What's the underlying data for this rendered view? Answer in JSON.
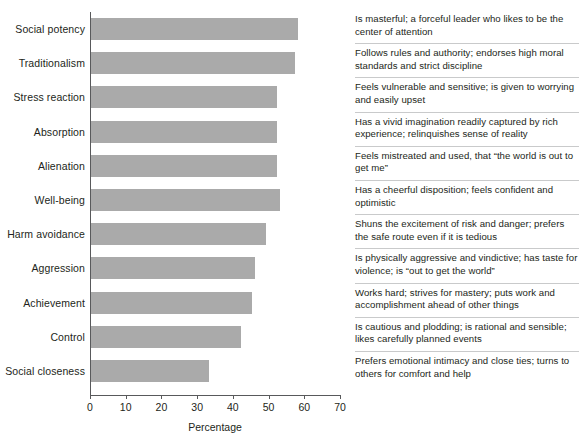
{
  "chart_data": {
    "type": "bar",
    "orientation": "horizontal",
    "title": "",
    "xlabel": "Percentage",
    "ylabel": "",
    "xlim": [
      0,
      70
    ],
    "xticks": [
      0,
      10,
      20,
      30,
      40,
      50,
      60,
      70
    ],
    "grid": false,
    "legend": null,
    "bar_color": "#aaaaaa",
    "axis_color": "#58595b",
    "categories": [
      "Social potency",
      "Traditionalism",
      "Stress reaction",
      "Absorption",
      "Alienation",
      "Well-being",
      "Harm avoidance",
      "Aggression",
      "Achievement",
      "Control",
      "Social closeness"
    ],
    "values": [
      58,
      57,
      52,
      52,
      52,
      53,
      49,
      46,
      45,
      42,
      33
    ],
    "descriptions": [
      "Is masterful; a forceful leader who likes to be the center of attention",
      "Follows rules and authority; endorses high moral standards and strict discipline",
      "Feels vulnerable and sensitive; is given to worrying and easily upset",
      "Has a vivid imagination readily captured by rich experience; relinquishes sense of reality",
      "Feels mistreated and used, that “the world is out to get me”",
      "Has a cheerful disposition; feels confident and optimistic",
      "Shuns the excitement of risk and danger; prefers the safe route even if it is tedious",
      "Is physically aggressive and vindictive; has taste for violence; is “out to get the world”",
      "Works hard; strives for mastery; puts work and accomplishment ahead of other things",
      "Is cautious and plodding; is rational and sensible; likes carefully planned events",
      "Prefers emotional intimacy and close ties; turns to others for comfort and help"
    ]
  }
}
